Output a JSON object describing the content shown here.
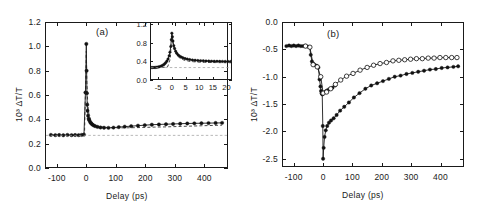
{
  "figure": {
    "caption_labels": {
      "panel_a": "(a)",
      "panel_b": "(b)"
    },
    "axis_titles": {
      "x": "Delay  (ps)",
      "y": "10³ ΔT/T"
    }
  },
  "chart_data": [
    {
      "type": "line",
      "id": "panel-a",
      "title": "(a)",
      "xlabel": "Delay  (ps)",
      "ylabel": "10³ ΔT/T",
      "xlim": [
        -140,
        480
      ],
      "ylim": [
        0.0,
        1.2
      ],
      "xticks": [
        -100,
        0,
        100,
        200,
        300,
        400
      ],
      "yticks": [
        0.0,
        0.2,
        0.4,
        0.6,
        0.8,
        1.0,
        1.2
      ],
      "xtick_labels": [
        "-100",
        "0",
        "100",
        "200",
        "300",
        "400"
      ],
      "ytick_labels": [
        "0.0",
        "0.2",
        "0.4",
        "0.6",
        "0.8",
        "1.0",
        "1.2"
      ],
      "grid": false,
      "legend": "none",
      "annotations": [
        {
          "text": "(a)",
          "x": 170,
          "y": 1.1
        }
      ],
      "series": [
        {
          "name": "data (filled circles)",
          "marker": "filled-circle",
          "x": [
            -120,
            -105,
            -92,
            -78,
            -64,
            -50,
            -38,
            -26,
            -16,
            -8,
            -3,
            0,
            1,
            2,
            3,
            4,
            6,
            8,
            10,
            13,
            16,
            20,
            25,
            30,
            38,
            48,
            60,
            75,
            92,
            110,
            130,
            152,
            175,
            198,
            222,
            246,
            270,
            294,
            318,
            342,
            366,
            390,
            414,
            438,
            460
          ],
          "y": [
            0.272,
            0.27,
            0.271,
            0.269,
            0.272,
            0.27,
            0.271,
            0.27,
            0.272,
            0.274,
            0.62,
            1.02,
            0.8,
            0.615,
            0.52,
            0.47,
            0.43,
            0.405,
            0.392,
            0.378,
            0.368,
            0.358,
            0.35,
            0.344,
            0.338,
            0.333,
            0.331,
            0.33,
            0.332,
            0.336,
            0.34,
            0.344,
            0.348,
            0.352,
            0.356,
            0.358,
            0.36,
            0.362,
            0.364,
            0.366,
            0.367,
            0.368,
            0.369,
            0.37,
            0.371
          ]
        },
        {
          "name": "fit (dashed)",
          "marker": "none",
          "style": "dashed",
          "x": [
            -120,
            -20,
            -6,
            0,
            2,
            5,
            9,
            14,
            20,
            30,
            45,
            65,
            90,
            120,
            155,
            190,
            230,
            270,
            310,
            350,
            390,
            430,
            460
          ],
          "y": [
            0.27,
            0.27,
            0.29,
            0.96,
            0.7,
            0.52,
            0.44,
            0.4,
            0.375,
            0.352,
            0.34,
            0.334,
            0.331,
            0.33,
            0.331,
            0.333,
            0.336,
            0.338,
            0.341,
            0.344,
            0.347,
            0.35,
            0.352
          ]
        },
        {
          "name": "baseline (dotted)",
          "marker": "none",
          "style": "dotted",
          "level": 0.268
        }
      ]
    },
    {
      "type": "line",
      "id": "panel-a-inset",
      "title": "",
      "xlabel": "",
      "ylabel": "",
      "xlim": [
        -8,
        22
      ],
      "ylim": [
        0.0,
        1.25
      ],
      "xticks": [
        -5,
        0,
        5,
        10,
        15,
        20
      ],
      "yticks": [
        0.0,
        0.4,
        0.8,
        1.2
      ],
      "xtick_labels": [
        "-5",
        "0",
        "5",
        "10",
        "15",
        "20"
      ],
      "ytick_labels": [
        "0.0",
        "0.4",
        "0.8",
        "1.2"
      ],
      "grid": false,
      "legend": "none",
      "series": [
        {
          "name": "data (filled circles)",
          "marker": "filled-circle",
          "x": [
            -7.5,
            -7,
            -6.5,
            -6,
            -5.5,
            -5,
            -4.5,
            -4,
            -3.5,
            -3,
            -2.6,
            -2.2,
            -1.8,
            -1.4,
            -1.0,
            -0.7,
            -0.4,
            -0.2,
            0.0,
            0.2,
            0.4,
            0.7,
            1.0,
            1.4,
            1.8,
            2.3,
            2.8,
            3.4,
            4.0,
            4.8,
            5.6,
            6.5,
            7.5,
            8.5,
            9.5,
            10.5,
            11.5,
            12.5,
            13.5,
            14.5,
            15.5,
            16.5,
            17.5,
            18.5,
            19.5,
            20.5,
            21.5
          ],
          "y": [
            0.268,
            0.268,
            0.27,
            0.272,
            0.275,
            0.28,
            0.288,
            0.298,
            0.312,
            0.33,
            0.35,
            0.375,
            0.41,
            0.455,
            0.52,
            0.6,
            0.72,
            0.87,
            1.01,
            0.93,
            0.84,
            0.74,
            0.68,
            0.62,
            0.575,
            0.54,
            0.515,
            0.495,
            0.478,
            0.462,
            0.45,
            0.44,
            0.432,
            0.425,
            0.42,
            0.416,
            0.413,
            0.41,
            0.408,
            0.406,
            0.404,
            0.403,
            0.402,
            0.401,
            0.4,
            0.4,
            0.399
          ]
        },
        {
          "name": "fit (dashed)",
          "marker": "none",
          "style": "dashed",
          "x": [
            -7.5,
            -3,
            -1.5,
            -0.6,
            -0.1,
            0.3,
            0.9,
            1.6,
            2.5,
            3.6,
            5.0,
            7.0,
            9.5,
            12.0,
            15.0,
            18.0,
            21.5
          ],
          "y": [
            0.268,
            0.27,
            0.29,
            0.45,
            0.93,
            0.82,
            0.66,
            0.56,
            0.49,
            0.448,
            0.418,
            0.398,
            0.386,
            0.38,
            0.376,
            0.374,
            0.372
          ]
        },
        {
          "name": "baseline (dotted)",
          "marker": "none",
          "style": "dotted",
          "level": 0.268
        }
      ]
    },
    {
      "type": "line",
      "id": "panel-b",
      "title": "(b)",
      "xlabel": "Delay  (ps)",
      "ylabel": "10³ ΔT/T",
      "xlim": [
        -140,
        480
      ],
      "ylim": [
        -2.65,
        0.0
      ],
      "xticks": [
        -100,
        0,
        100,
        200,
        300,
        400
      ],
      "yticks": [
        0.0,
        -0.5,
        -1.0,
        -1.5,
        -2.0,
        -2.5
      ],
      "xtick_labels": [
        "-100",
        "0",
        "100",
        "200",
        "300",
        "400"
      ],
      "ytick_labels": [
        "0.0",
        "-0.5",
        "-1.0",
        "-1.5",
        "-2.0",
        "-2.5"
      ],
      "grid": false,
      "legend": "none",
      "annotations": [
        {
          "text": "(b)",
          "x": 60,
          "y": -0.33
        }
      ],
      "series": [
        {
          "name": "series 1 (filled circles)",
          "marker": "filled-circle",
          "x": [
            -125,
            -116,
            -108,
            -100,
            -92,
            -84,
            -76,
            -68,
            -60,
            -52,
            -46,
            -42,
            -38,
            -34,
            -30,
            -22,
            -16,
            -12,
            -9,
            -7,
            -5,
            -3,
            -1,
            0,
            2,
            5,
            9,
            14,
            20,
            27,
            36,
            46,
            58,
            72,
            88,
            105,
            124,
            144,
            164,
            184,
            204,
            224,
            244,
            264,
            284,
            304,
            324,
            344,
            364,
            384,
            404,
            424,
            444,
            460
          ],
          "y": [
            -0.44,
            -0.43,
            -0.44,
            -0.43,
            -0.44,
            -0.43,
            -0.44,
            -0.44,
            -0.44,
            -0.45,
            -0.46,
            -0.6,
            -0.72,
            -0.76,
            -0.78,
            -0.8,
            -0.83,
            -1.05,
            -1.18,
            -1.26,
            -1.3,
            -1.32,
            -1.9,
            -2.5,
            -2.3,
            -2.1,
            -1.98,
            -1.9,
            -1.84,
            -1.8,
            -1.76,
            -1.7,
            -1.62,
            -1.55,
            -1.47,
            -1.38,
            -1.3,
            -1.22,
            -1.16,
            -1.12,
            -1.08,
            -1.04,
            -1.0,
            -0.98,
            -0.95,
            -0.93,
            -0.91,
            -0.89,
            -0.87,
            -0.86,
            -0.84,
            -0.83,
            -0.82,
            -0.81
          ]
        },
        {
          "name": "series 1 low-delay branch (filled circles)",
          "marker": "filled-circle",
          "x": [
            -2,
            2,
            6,
            11,
            17,
            24,
            32,
            41
          ],
          "y": [
            -1.32,
            -1.3,
            -1.28,
            -1.26,
            -1.24,
            -1.22,
            -1.2,
            -1.16
          ]
        },
        {
          "name": "series 2 (open circles)",
          "marker": "open-circle",
          "x": [
            -60,
            -45,
            -34,
            -20,
            -8,
            0,
            12,
            26,
            42,
            60,
            80,
            102,
            126,
            150,
            172,
            194,
            216,
            238,
            258,
            278,
            298,
            318,
            338,
            358,
            378,
            398,
            418,
            438,
            456
          ],
          "y": [
            -0.44,
            -0.46,
            -0.78,
            -0.82,
            -1.0,
            -1.3,
            -1.28,
            -1.22,
            -1.14,
            -1.06,
            -0.99,
            -0.94,
            -0.88,
            -0.83,
            -0.79,
            -0.76,
            -0.74,
            -0.71,
            -0.7,
            -0.69,
            -0.68,
            -0.67,
            -0.67,
            -0.66,
            -0.66,
            -0.65,
            -0.65,
            -0.65,
            -0.65
          ]
        }
      ]
    }
  ]
}
